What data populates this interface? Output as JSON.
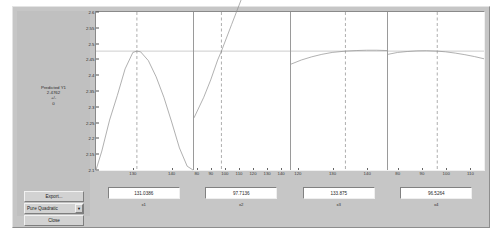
{
  "window": {
    "title": "rstool"
  },
  "controls": {
    "export_label": "Export...",
    "close_label": "Close",
    "model_selected": "Pure Quadratic",
    "model_options": [
      "Linear",
      "Pure Quadratic",
      "Interactions",
      "Full Quadratic"
    ],
    "dropdown_arrow": "▼"
  },
  "readout": {
    "title": "Predicted Y1",
    "value": "2.4762",
    "plusminus": "+/-",
    "error": "0"
  },
  "chart_data": {
    "type": "line",
    "title": "",
    "layout": "1x4 response surface prediction panels",
    "ylabel": "",
    "ylim": [
      2.1,
      2.6
    ],
    "yticks": [
      "2.6",
      "2.55",
      "2.5",
      "2.45",
      "2.4",
      "2.35",
      "2.3",
      "2.25",
      "2.2",
      "2.15",
      "2.1"
    ],
    "ytickvalues": [
      2.6,
      2.55,
      2.5,
      2.45,
      2.4,
      2.35,
      2.3,
      2.25,
      2.2,
      2.15,
      2.1
    ],
    "reference_line_y": 2.4762,
    "grid": false,
    "legend": false,
    "panels": [
      {
        "name": "x1",
        "xlabel": "x1",
        "value_label": "131.0386",
        "value": 131.0386,
        "xlim": [
          120.5,
          145.5
        ],
        "xticks": [
          130,
          140
        ],
        "xticklabels": [
          "130",
          "140"
        ],
        "crosshair_x": 131.0386,
        "curve_x": [
          120.5,
          122,
          124,
          126,
          128,
          130,
          131.04,
          132,
          134,
          136,
          138,
          140,
          142,
          144,
          145.5
        ],
        "curve_y": [
          2.1,
          2.16,
          2.258,
          2.336,
          2.42,
          2.472,
          2.4762,
          2.474,
          2.446,
          2.395,
          2.33,
          2.252,
          2.17,
          2.112,
          2.1
        ]
      },
      {
        "name": "x2",
        "xlabel": "x2",
        "value_label": "97.7136",
        "value": 97.7136,
        "xlim": [
          78,
          147
        ],
        "xticks": [
          80,
          90,
          100,
          110,
          120,
          130,
          140
        ],
        "xticklabels": [
          "80",
          "90",
          "100",
          "110",
          "120",
          "130",
          "140"
        ],
        "crosshair_x": 97.7136,
        "curve_x": [
          78,
          85,
          90,
          95,
          97.71,
          105,
          112,
          120,
          128,
          135,
          140,
          147
        ],
        "curve_y": [
          2.265,
          2.33,
          2.385,
          2.448,
          2.4762,
          2.56,
          2.64,
          2.73,
          2.82,
          2.9,
          2.955,
          3.03
        ]
      },
      {
        "name": "x3",
        "xlabel": "x3",
        "value_label": "133.875",
        "value": 133.875,
        "xlim": [
          118,
          146
        ],
        "xticks": [
          120,
          130,
          140
        ],
        "xticklabels": [
          "120",
          "130",
          "140"
        ],
        "crosshair_x": 133.875,
        "curve_x": [
          118,
          121,
          124,
          127,
          130,
          133.875,
          137,
          140,
          143,
          146
        ],
        "curve_y": [
          2.435,
          2.448,
          2.458,
          2.466,
          2.472,
          2.4762,
          2.478,
          2.479,
          2.479,
          2.478
        ]
      },
      {
        "name": "x4",
        "xlabel": "x4",
        "value_label": "96.5264",
        "value": 96.5264,
        "xlim": [
          76,
          116
        ],
        "xticks": [
          80,
          90,
          100,
          110
        ],
        "xticklabels": [
          "80",
          "90",
          "100",
          "110"
        ],
        "crosshair_x": 96.5264,
        "curve_x": [
          76,
          80,
          84,
          88,
          92,
          96.5264,
          100,
          104,
          108,
          112,
          116
        ],
        "curve_y": [
          2.466,
          2.472,
          2.475,
          2.477,
          2.4775,
          2.4762,
          2.474,
          2.47,
          2.465,
          2.459,
          2.452
        ]
      }
    ]
  }
}
